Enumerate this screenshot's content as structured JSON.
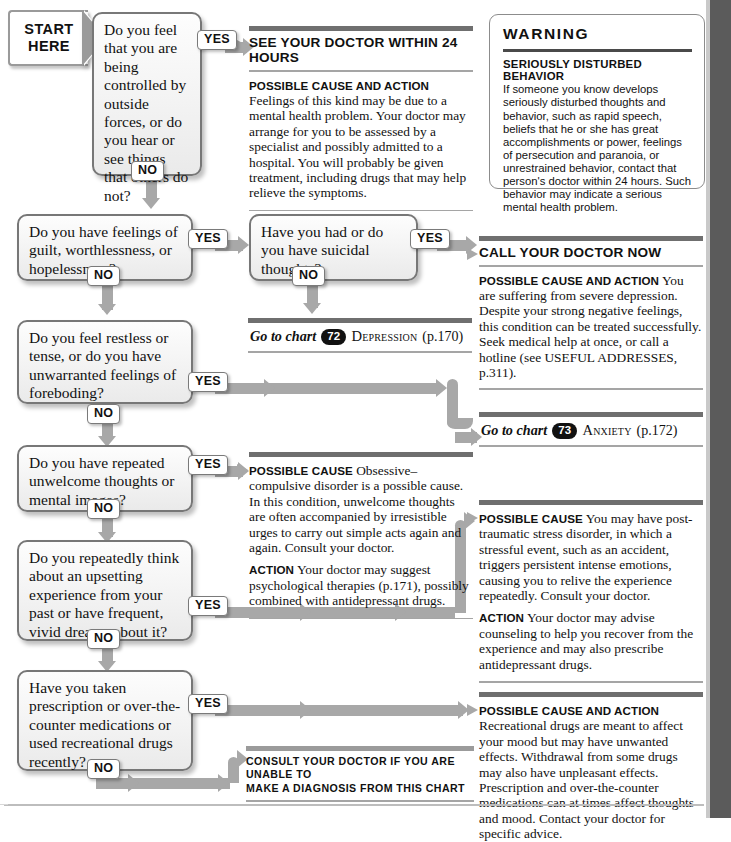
{
  "start": {
    "line1": "START",
    "line2": "HERE"
  },
  "answers": {
    "yes": "YES",
    "no": "NO"
  },
  "questions": [
    {
      "id": "q1",
      "text": "Do you feel that you are being controlled by outside forces, or do you hear or see things that others do not?"
    },
    {
      "id": "q2",
      "text": "Do you have feelings of guilt, worthlessness, or hopelessness?"
    },
    {
      "id": "q3",
      "text": "Have you had or do you have suicidal thoughts?"
    },
    {
      "id": "q4",
      "text": "Do you feel restless or tense, or do you have unwarranted feelings of foreboding?"
    },
    {
      "id": "q5",
      "text": "Do you have repeated unwelcome thoughts or mental images?"
    },
    {
      "id": "q6",
      "text": "Do you repeatedly think about an upsetting experience from your past or have frequent, vivid dreams about it?"
    },
    {
      "id": "q7",
      "text": "Have you taken prescription or over-the-counter medications or used recreational drugs recently?"
    }
  ],
  "panels": {
    "see_doctor_24h": {
      "heading": "SEE YOUR DOCTOR WITHIN 24 HOURS",
      "lead": "Possible cause and action",
      "body": "Feelings of this kind may be due to a mental health problem. Your doctor may arrange for you to be assessed by a specialist and possibly admitted to a hospital. You will probably be given treatment, including drugs that may help relieve the symptoms."
    },
    "call_doctor_now": {
      "heading": "CALL YOUR DOCTOR NOW",
      "lead": "Possible cause and action",
      "body": "You are suffering from severe depression. Despite your strong negative feelings, this condition can be treated successfully. Seek medical help at once, or call a hotline (see USEFUL ADDRESSES, p.311)."
    },
    "ocd": {
      "lead": "Possible cause",
      "body": "Obsessive–compulsive disorder is a possible cause. In this condition, unwelcome thoughts are often accompanied by irresistible urges to carry out simple acts again and again. Consult your doctor.",
      "action_lead": "Action",
      "action_body": "Your doctor may suggest psychological therapies (p.171), possibly combined with antidepressant drugs."
    },
    "ptsd": {
      "lead": "Possible cause",
      "body": "You may have post-traumatic stress disorder, in which a stressful event, such as an accident, triggers persistent intense emotions, causing you to relive the experience repeatedly. Consult your doctor.",
      "action_lead": "Action",
      "action_body": "Your doctor may advise counseling to help you recover from the experience and may also prescribe antidepressant drugs."
    },
    "drugs": {
      "lead": "Possible cause and action",
      "body": "Recreational drugs are meant to affect your mood but may have unwanted effects. Withdrawal from some drugs may also have unpleasant effects. Prescription and over-the-counter medications can at times affect thoughts and mood. Contact your doctor for specific advice."
    }
  },
  "warning": {
    "title": "WARNING",
    "subtitle": "Seriously disturbed behavior",
    "body": "If someone you know develops seriously disturbed thoughts and behavior, such as rapid speech, beliefs that he or she has great accomplishments or power, feelings of persecution and paranoia, or unrestrained behavior, contact that person's doctor within 24 hours. Such behavior may indicate a serious mental health problem."
  },
  "go_to_chart": [
    {
      "label": "Go to chart",
      "number": "72",
      "name": "Depression",
      "page": "(p.170)"
    },
    {
      "label": "Go to chart",
      "number": "73",
      "name": "Anxiety",
      "page": "(p.172)"
    }
  ],
  "consult": {
    "line1": "Consult your doctor if you are unable to",
    "line2": "make a diagnosis from this chart"
  },
  "colors": {
    "connector": "#a8a8a8",
    "bar": "#6f6f6f",
    "rule": "#a5a5a5",
    "edge": "#5b5b5b"
  }
}
